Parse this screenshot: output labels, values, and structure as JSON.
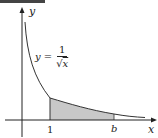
{
  "figure": {
    "axis_labels": {
      "x": "x",
      "y": "y"
    },
    "function": {
      "lhs": "y =",
      "numerator": "1",
      "radical": "√",
      "radicand": "x",
      "expression": "y = 1/√x"
    },
    "x_ticks": [
      {
        "label": "1",
        "value": 1
      },
      {
        "label": "b",
        "value": "b"
      }
    ],
    "shaded_region": {
      "from": "1",
      "to": "b",
      "color": "#c8c8c8"
    },
    "colors": {
      "axis": "#222222",
      "curve": "#333333",
      "shade": "#c8c8c8",
      "top_bar": "#444444"
    }
  }
}
